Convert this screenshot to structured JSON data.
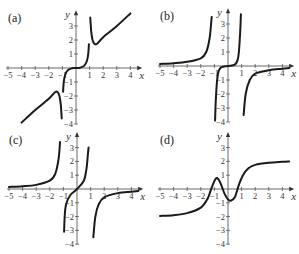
{
  "chart_data": [
    {
      "id": "a",
      "type": "line",
      "panel_label": "(a)",
      "xlabel": "x",
      "ylabel": "y",
      "xlim": [
        -5,
        4.5
      ],
      "ylim": [
        -4,
        3.7
      ],
      "x_ticks": [
        -5,
        -4,
        -3,
        -2,
        -1,
        1,
        2,
        3,
        4
      ],
      "y_ticks": [
        -4,
        -3,
        -2,
        -1,
        1,
        2,
        3
      ],
      "grid": false,
      "asymptotes_x": [
        -1,
        1
      ],
      "series": [
        {
          "name": "left-branch",
          "points": [
            [
              -4,
              -3.9
            ],
            [
              -3,
              -3.0
            ],
            [
              -2,
              -2.2
            ],
            [
              -1.5,
              -1.7
            ],
            [
              -1.25,
              -1.9
            ],
            [
              -1.12,
              -2.6
            ],
            [
              -1.05,
              -3.6
            ]
          ]
        },
        {
          "name": "middle-branch",
          "points": [
            [
              -0.95,
              -1.7
            ],
            [
              -0.9,
              -1.0
            ],
            [
              -0.8,
              -0.5
            ],
            [
              -0.6,
              -0.15
            ],
            [
              -0.3,
              -0.02
            ],
            [
              0,
              0
            ],
            [
              0.3,
              0.02
            ],
            [
              0.6,
              0.15
            ],
            [
              0.8,
              0.5
            ],
            [
              0.9,
              1.0
            ],
            [
              0.95,
              1.7
            ]
          ]
        },
        {
          "name": "right-branch",
          "points": [
            [
              1.05,
              3.6
            ],
            [
              1.12,
              2.6
            ],
            [
              1.25,
              1.9
            ],
            [
              1.5,
              1.7
            ],
            [
              2,
              2.2
            ],
            [
              3,
              3.0
            ],
            [
              4,
              3.9
            ]
          ]
        }
      ]
    },
    {
      "id": "b",
      "type": "line",
      "panel_label": "(b)",
      "xlabel": "x",
      "ylabel": "y",
      "xlim": [
        -5,
        4.5
      ],
      "ylim": [
        -4,
        3.7
      ],
      "x_ticks": [
        -5,
        -4,
        -3,
        -2,
        -1,
        1,
        2,
        3,
        4
      ],
      "y_ticks": [
        -4,
        -3,
        -2,
        -1,
        1,
        2,
        3
      ],
      "grid": false,
      "asymptotes_x": [
        -1,
        1
      ],
      "series": [
        {
          "name": "left-branch",
          "points": [
            [
              -5,
              0.15
            ],
            [
              -4,
              0.2
            ],
            [
              -3,
              0.3
            ],
            [
              -2,
              0.55
            ],
            [
              -1.6,
              1.0
            ],
            [
              -1.35,
              2.0
            ],
            [
              -1.2,
              3.5
            ]
          ]
        },
        {
          "name": "middle-branch",
          "points": [
            [
              -0.95,
              -3.9
            ],
            [
              -0.9,
              -2.5
            ],
            [
              -0.8,
              -1.0
            ],
            [
              -0.7,
              -0.4
            ],
            [
              -0.5,
              -0.1
            ],
            [
              0,
              0
            ],
            [
              0.5,
              0.1
            ],
            [
              0.7,
              0.4
            ],
            [
              0.8,
              1.0
            ],
            [
              0.9,
              2.5
            ],
            [
              0.95,
              3.7
            ]
          ]
        },
        {
          "name": "right-branch",
          "points": [
            [
              1.15,
              -3.5
            ],
            [
              1.3,
              -2.0
            ],
            [
              1.6,
              -1.0
            ],
            [
              2,
              -0.55
            ],
            [
              3,
              -0.3
            ],
            [
              4,
              -0.2
            ],
            [
              4.5,
              -0.15
            ]
          ]
        }
      ]
    },
    {
      "id": "c",
      "type": "line",
      "panel_label": "(c)",
      "xlabel": "x",
      "ylabel": "y",
      "xlim": [
        -5,
        4.5
      ],
      "ylim": [
        -4,
        3.7
      ],
      "x_ticks": [
        -5,
        -4,
        -3,
        -2,
        -1,
        1,
        2,
        3,
        4
      ],
      "y_ticks": [
        -4,
        -3,
        -2,
        -1,
        1,
        2,
        3
      ],
      "grid": false,
      "asymptotes_x": [
        -1,
        1
      ],
      "series": [
        {
          "name": "left-branch",
          "points": [
            [
              -5,
              0.15
            ],
            [
              -4,
              0.2
            ],
            [
              -3,
              0.3
            ],
            [
              -2,
              0.6
            ],
            [
              -1.6,
              1.1
            ],
            [
              -1.35,
              2.2
            ],
            [
              -1.25,
              3.4
            ]
          ]
        },
        {
          "name": "middle-branch",
          "points": [
            [
              -0.95,
              -3.1
            ],
            [
              -0.9,
              -1.9
            ],
            [
              -0.8,
              -1.1
            ],
            [
              -0.5,
              -0.45
            ],
            [
              0,
              0
            ],
            [
              0.5,
              0.6
            ],
            [
              0.7,
              1.5
            ],
            [
              0.8,
              2.5
            ],
            [
              0.85,
              3.0
            ]
          ]
        },
        {
          "name": "right-branch",
          "points": [
            [
              1.2,
              -3.5
            ],
            [
              1.35,
              -2.0
            ],
            [
              1.6,
              -1.1
            ],
            [
              2,
              -0.6
            ],
            [
              3,
              -0.3
            ],
            [
              4,
              -0.2
            ],
            [
              4.5,
              -0.15
            ]
          ]
        }
      ]
    },
    {
      "id": "d",
      "type": "line",
      "panel_label": "(d)",
      "xlabel": "x",
      "ylabel": "y",
      "xlim": [
        -5,
        4.5
      ],
      "ylim": [
        -4,
        3.7
      ],
      "x_ticks": [
        -5,
        -4,
        -3,
        -2,
        -1,
        1,
        2,
        3,
        4
      ],
      "y_ticks": [
        -4,
        -3,
        -2,
        -1,
        1,
        2,
        3
      ],
      "grid": false,
      "asymptotes_x": [],
      "series": [
        {
          "name": "curve",
          "points": [
            [
              -5,
              -1.95
            ],
            [
              -4,
              -1.9
            ],
            [
              -3,
              -1.75
            ],
            [
              -2,
              -1.35
            ],
            [
              -1.5,
              -0.7
            ],
            [
              -1.2,
              0.1
            ],
            [
              -0.9,
              0.75
            ],
            [
              -0.7,
              0.7
            ],
            [
              -0.5,
              0.3
            ],
            [
              -0.25,
              -0.35
            ],
            [
              0,
              -0.75
            ],
            [
              0.2,
              -0.85
            ],
            [
              0.5,
              -0.6
            ],
            [
              0.8,
              0.3
            ],
            [
              1.1,
              1.0
            ],
            [
              1.5,
              1.5
            ],
            [
              2,
              1.75
            ],
            [
              3,
              1.9
            ],
            [
              4,
              1.97
            ],
            [
              4.5,
              2.0
            ]
          ]
        }
      ]
    }
  ],
  "panels": [
    {
      "label": "(a)",
      "origin": [
        76,
        68
      ],
      "px_per_unit": [
        13.6,
        14.0
      ]
    },
    {
      "label": "(b)",
      "origin": [
        228,
        66
      ],
      "px_per_unit": [
        13.6,
        14.0
      ]
    },
    {
      "label": "(c)",
      "origin": [
        77,
        189
      ],
      "px_per_unit": [
        13.6,
        13.8
      ]
    },
    {
      "label": "(d)",
      "origin": [
        228,
        189
      ],
      "px_per_unit": [
        13.6,
        13.8
      ]
    }
  ]
}
